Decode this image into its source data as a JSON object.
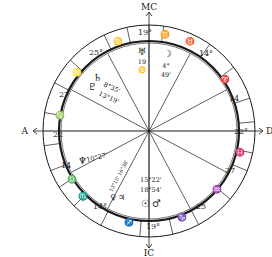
{
  "chart_title": "Natal chart wheel",
  "angles": {
    "mc": "MC",
    "ic": "IC",
    "asc": "A",
    "desc": "D"
  },
  "cusps": [
    {
      "house_line": "MC",
      "degree": "19°",
      "sign": "♊",
      "sign_name": "Gemini"
    },
    {
      "degree": "",
      "sign": "♉",
      "sign_name": "Taurus"
    },
    {
      "degree": "14°",
      "sign": "",
      "sign_name": ""
    },
    {
      "degree": "",
      "sign": "♈",
      "sign_name": "Aries"
    },
    {
      "degree": "14",
      "sign": "",
      "sign_name": ""
    },
    {
      "house_line": "DESC",
      "degree": "22°",
      "sign": "",
      "sign_name": ""
    },
    {
      "degree": "",
      "sign": "♓",
      "sign_name": "Pisces"
    },
    {
      "degree": "27",
      "sign": "",
      "sign_name": ""
    },
    {
      "degree": "",
      "sign": "♒",
      "sign_name": "Aquarius"
    },
    {
      "degree": "25",
      "sign": "",
      "sign_name": ""
    },
    {
      "degree": "",
      "sign": "♑",
      "sign_name": "Capricorn"
    },
    {
      "house_line": "IC",
      "degree": "19°",
      "sign": "",
      "sign_name": ""
    },
    {
      "degree": "",
      "sign": "♐",
      "sign_name": "Sagittarius"
    },
    {
      "degree": "14°",
      "sign": "",
      "sign_name": ""
    },
    {
      "degree": "",
      "sign": "♏",
      "sign_name": "Scorpio"
    },
    {
      "degree": "",
      "sign": "♎",
      "sign_name": "Libra"
    },
    {
      "degree": "14",
      "sign": "",
      "sign_name": ""
    },
    {
      "house_line": "ASC",
      "degree": "22",
      "sign": "",
      "sign_name": ""
    },
    {
      "degree": "",
      "sign": "♍",
      "sign_name": "Virgo"
    },
    {
      "degree": "27",
      "sign": "",
      "sign_name": ""
    },
    {
      "degree": "",
      "sign": "♌",
      "sign_name": "Leo"
    },
    {
      "degree": "25°",
      "sign": "",
      "sign_name": ""
    },
    {
      "degree": "",
      "sign": "♋",
      "sign_name": "Cancer"
    }
  ],
  "planets": [
    {
      "name": "Uranus",
      "glyph": "♅",
      "position": "19",
      "position2": "♋"
    },
    {
      "name": "Moon",
      "glyph": "☽",
      "degree": "4°",
      "minute": "49'"
    },
    {
      "name": "Saturn",
      "glyph": "♄",
      "position": "8°35'"
    },
    {
      "name": "Pluto",
      "glyph": "♇",
      "position": "13°19'"
    },
    {
      "name": "Neptune",
      "glyph": "♆",
      "position": "10°27'"
    },
    {
      "name": "Mercury",
      "glyph": "☿",
      "position": "15°22'"
    },
    {
      "name": "Sun",
      "glyph": "☉",
      "position": "18°54'"
    },
    {
      "name": "Mars",
      "glyph": "♂",
      "position": ""
    },
    {
      "name": "Venus",
      "glyph": "♀",
      "position": ""
    },
    {
      "name": "Jupiter",
      "glyph": "♃",
      "position": ""
    }
  ],
  "labels": {
    "uranus_deg": "19",
    "uranus_sign": "♋",
    "moon_deg": "4°",
    "moon_min": "49'",
    "saturn_pos": "8°35'",
    "pluto_pos": "13°19'",
    "neptune_pos": "10°27'",
    "mercury_pos": "15°22'",
    "sun_pos": "18°54'",
    "cluster_text": "13°10' 16°38'"
  }
}
